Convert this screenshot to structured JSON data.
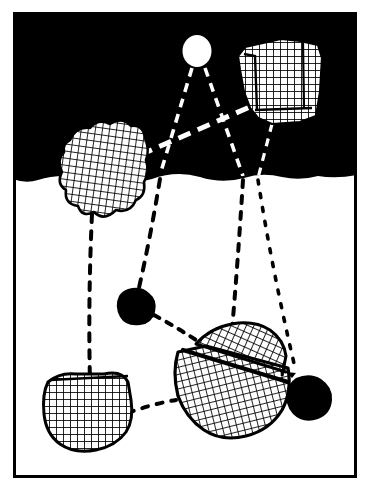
{
  "figure": {
    "title": "Night landscape with cross-hatched rocks and dotted sight-lines",
    "type": "line-art-illustration",
    "width": 372,
    "height": 493,
    "colors": {
      "ink": "#000000",
      "paper": "#ffffff",
      "sky": "#000000",
      "ground": "#ffffff"
    },
    "frame": {
      "label": "border-frame",
      "x": 13,
      "y": 12,
      "width": 344,
      "height": 466,
      "stroke_width": 3
    },
    "sky": {
      "label": "night-sky",
      "fill": "#000000",
      "top": 12,
      "bottom": 179
    },
    "ground": {
      "label": "ground-plane",
      "fill": "#ffffff",
      "top": 179,
      "bottom": 477
    },
    "horizon": {
      "label": "horizon-line",
      "y": 179
    },
    "objects": [
      {
        "id": "moon",
        "label": "moon",
        "shape": "ellipse",
        "fill": "#ffffff",
        "cx": 197,
        "cy": 51,
        "rx": 14,
        "ry": 16
      },
      {
        "id": "rock-top-right",
        "label": "hatched-rock-upper-right",
        "shape": "angular-polygon",
        "fill": "hatch",
        "cx": 278,
        "cy": 84
      },
      {
        "id": "rock-cloud-left",
        "label": "hatched-rock-cloud-left",
        "shape": "lumpy-blob",
        "fill": "hatch",
        "cx": 100,
        "cy": 172
      },
      {
        "id": "pebble-center",
        "label": "solid-black-pebble-center",
        "shape": "blob",
        "fill": "#000000",
        "cx": 138,
        "cy": 306
      },
      {
        "id": "rock-center-large",
        "label": "hatched-rock-center-large",
        "shape": "two-faceted-polygon",
        "fill": "hatch",
        "cx": 226,
        "cy": 376
      },
      {
        "id": "rock-bottom-left",
        "label": "hatched-rock-bottom-left",
        "shape": "rounded-polygon",
        "fill": "hatch",
        "cx": 86,
        "cy": 404
      },
      {
        "id": "pebble-bottom-right",
        "label": "solid-black-pebble-bottom-right",
        "shape": "blob",
        "fill": "#000000",
        "cx": 309,
        "cy": 398
      }
    ],
    "connections": [
      {
        "id": "c1",
        "label": "moon-to-pebble-center",
        "from": "moon",
        "to": "pebble-center",
        "style": "dashed",
        "color": "#ffffff-then-#000000"
      },
      {
        "id": "c2",
        "label": "moon-to-rock-center-large",
        "from": "moon",
        "to": "rock-center-large",
        "style": "dashed",
        "color": "#ffffff-then-#000000"
      },
      {
        "id": "c3",
        "label": "cloud-rock-to-upper-right-rock",
        "from": "rock-cloud-left",
        "to": "rock-top-right",
        "style": "thick-dashed",
        "color": "#ffffff"
      },
      {
        "id": "c4",
        "label": "cloud-rock-to-bottom-left-rock",
        "from": "rock-cloud-left",
        "to": "rock-bottom-left",
        "style": "dashed",
        "color": "#000000"
      },
      {
        "id": "c5",
        "label": "upper-right-rock-to-pebble-bottom-right",
        "from": "rock-top-right",
        "to": "pebble-bottom-right",
        "style": "dotted",
        "color": "#000000"
      },
      {
        "id": "c6",
        "label": "pebble-center-to-rock-center-large",
        "from": "pebble-center",
        "to": "rock-center-large",
        "style": "dotted",
        "color": "#000000"
      },
      {
        "id": "c7",
        "label": "bottom-left-rock-to-rock-center-large",
        "from": "rock-bottom-left",
        "to": "rock-center-large",
        "style": "dotted",
        "color": "#000000"
      },
      {
        "id": "c8",
        "label": "rock-center-large-to-pebble-bottom-right",
        "from": "rock-center-large",
        "to": "pebble-bottom-right",
        "style": "dashed",
        "color": "#000000"
      }
    ]
  }
}
